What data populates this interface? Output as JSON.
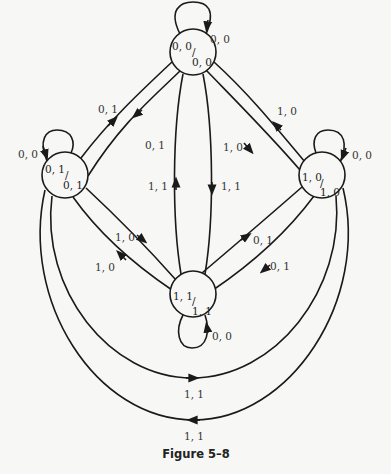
{
  "caption": "Figure 5–8",
  "nodes": {
    "top": {
      "top": "0, 0",
      "bottom": "0, 0",
      "slash": "/"
    },
    "left": {
      "top": "0, 1",
      "bottom": "0, 1",
      "slash": "/"
    },
    "right": {
      "top": "1, 0",
      "bottom": "1, 0",
      "slash": "/"
    },
    "bottom": {
      "top": "1, 1",
      "bottom": "1, 1",
      "slash": "/"
    }
  },
  "self_loops": {
    "top": "0, 0",
    "left": "0, 0",
    "right": "0, 0",
    "bottom": "0, 0"
  },
  "edges": {
    "left_to_top": "0, 1",
    "top_to_left": "0, 1",
    "right_to_top": "1, 0",
    "top_to_right": "1, 0",
    "bottom_to_top": "1, 1",
    "top_to_bottom": "1, 1",
    "left_to_bottom": "1, 0",
    "bottom_to_left": "1, 0",
    "bottom_to_right": "0, 1",
    "right_to_bottom": "0, 1",
    "left_to_right_outer_inner": "1, 1",
    "right_to_left_outer": "1, 1"
  }
}
